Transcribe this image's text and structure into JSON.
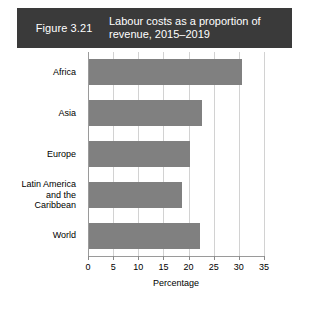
{
  "header": {
    "figure_number": "Figure 3.21",
    "title": "Labour costs as a proportion of revenue, 2015–2019",
    "band_color": "#3a3a3a",
    "text_color": "#ffffff"
  },
  "chart_data": {
    "type": "bar",
    "orientation": "horizontal",
    "title": "Labour costs as a proportion of revenue, 2015–2019",
    "categories": [
      "Africa",
      "Asia",
      "Europe",
      "Latin America and the Caribbean",
      "World"
    ],
    "category_lines": [
      [
        "Africa"
      ],
      [
        "Asia"
      ],
      [
        "Europe"
      ],
      [
        "Latin America",
        "and the",
        "Caribbean"
      ],
      [
        "World"
      ]
    ],
    "values": [
      30.5,
      22.5,
      20.0,
      18.5,
      22.0
    ],
    "xlabel": "Percentage",
    "ylabel": "",
    "xlim": [
      0,
      35
    ],
    "xticks": [
      0,
      5,
      10,
      15,
      20,
      25,
      30,
      35
    ],
    "xtick_labels": [
      "0",
      "5",
      "10",
      "15",
      "20",
      "25",
      "30",
      "35"
    ],
    "grid": "vertical",
    "legend": "none",
    "bar_color": "#808080",
    "gridline_color": "#d2d2d2",
    "axis_color": "#9a9a9a"
  }
}
